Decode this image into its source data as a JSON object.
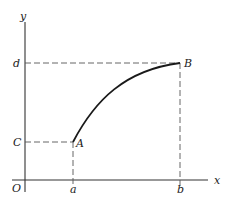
{
  "diagram": {
    "axes": {
      "x_label": "x",
      "y_label": "y",
      "origin_label": "O"
    },
    "x_ticks": [
      {
        "label": "a"
      },
      {
        "label": "b"
      }
    ],
    "y_ticks": [
      {
        "label": "C"
      },
      {
        "label": "d"
      }
    ],
    "points": [
      {
        "label": "A"
      },
      {
        "label": "B"
      }
    ],
    "curve": {
      "description": "increasing concave arc from A to B"
    },
    "colors": {
      "ink": "#222222",
      "background": "#ffffff"
    }
  }
}
